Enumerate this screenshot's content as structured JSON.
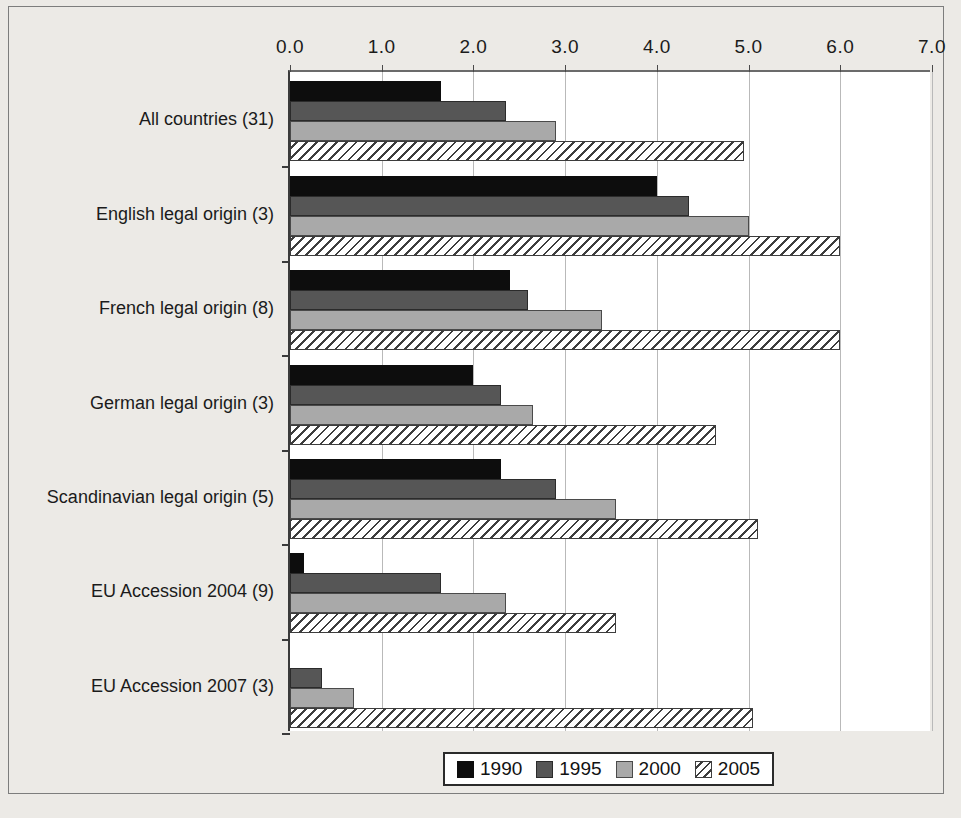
{
  "chart_data": {
    "type": "bar",
    "orientation": "horizontal",
    "title": "",
    "xlabel": "",
    "ylabel": "",
    "xlim": [
      0.0,
      7.0
    ],
    "xticks": [
      "0.0",
      "1.0",
      "2.0",
      "3.0",
      "4.0",
      "5.0",
      "6.0",
      "7.0"
    ],
    "grid": "vertical",
    "legend_position": "bottom-center",
    "categories": [
      "All countries (31)",
      "English legal origin (3)",
      "French legal origin (8)",
      "German legal origin (3)",
      "Scandinavian legal origin (5)",
      "EU Accession 2004 (9)",
      "EU Accession 2007 (3)"
    ],
    "series": [
      {
        "name": "1990",
        "color": "#0d0d0d",
        "pattern": "solid",
        "values": [
          1.65,
          4.0,
          2.4,
          2.0,
          2.3,
          0.15,
          0.0
        ]
      },
      {
        "name": "1995",
        "color": "#565656",
        "pattern": "solid",
        "values": [
          2.35,
          4.35,
          2.6,
          2.3,
          2.9,
          1.65,
          0.35
        ]
      },
      {
        "name": "2000",
        "color": "#a9a9a9",
        "pattern": "solid",
        "values": [
          2.9,
          5.0,
          3.4,
          2.65,
          3.55,
          2.35,
          0.7
        ]
      },
      {
        "name": "2005",
        "color": "#ffffff",
        "pattern": "diagonal-hatch",
        "values": [
          4.95,
          6.0,
          6.0,
          4.65,
          5.1,
          3.55,
          5.05
        ]
      }
    ]
  },
  "legend": {
    "items": [
      {
        "label": "1990"
      },
      {
        "label": "1995"
      },
      {
        "label": "2000"
      },
      {
        "label": "2005"
      }
    ]
  }
}
